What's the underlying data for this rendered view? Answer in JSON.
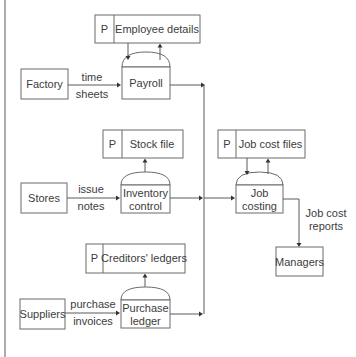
{
  "diagram": {
    "type": "data-flow-diagram",
    "external_entities": [
      {
        "id": "factory",
        "label": "Factory"
      },
      {
        "id": "stores",
        "label": "Stores"
      },
      {
        "id": "suppliers",
        "label": "Suppliers"
      },
      {
        "id": "managers",
        "label": "Managers"
      }
    ],
    "data_stores": [
      {
        "id": "employee_details",
        "prefix": "P",
        "label": "Employee details"
      },
      {
        "id": "stock_file",
        "prefix": "P",
        "label": "Stock file"
      },
      {
        "id": "job_cost_files",
        "prefix": "P",
        "label": "Job cost files"
      },
      {
        "id": "creditors_ledgers",
        "prefix": "P",
        "label": "Creditors' ledgers"
      }
    ],
    "processes": [
      {
        "id": "payroll",
        "lines": [
          "Payroll"
        ]
      },
      {
        "id": "inventory_control",
        "lines": [
          "Inventory",
          "control"
        ]
      },
      {
        "id": "job_costing",
        "lines": [
          "Job",
          "costing"
        ]
      },
      {
        "id": "purchase_ledger",
        "lines": [
          "Purchase",
          "ledger"
        ]
      }
    ],
    "flows": [
      {
        "from": "factory",
        "to": "payroll",
        "label": [
          "time",
          "sheets"
        ]
      },
      {
        "from": "stores",
        "to": "inventory_control",
        "label": [
          "issue",
          "notes"
        ]
      },
      {
        "from": "suppliers",
        "to": "purchase_ledger",
        "label": [
          "purchase",
          "invoices"
        ]
      },
      {
        "from": "job_costing",
        "to": "managers",
        "label": [
          "Job cost",
          "reports"
        ]
      },
      {
        "from": "employee_details",
        "to": "payroll",
        "label": []
      },
      {
        "from": "payroll",
        "to": "employee_details",
        "label": []
      },
      {
        "from": "inventory_control",
        "to": "stock_file",
        "label": []
      },
      {
        "from": "job_cost_files",
        "to": "job_costing",
        "label": []
      },
      {
        "from": "job_costing",
        "to": "job_cost_files",
        "label": []
      },
      {
        "from": "purchase_ledger",
        "to": "creditors_ledgers",
        "label": []
      },
      {
        "from": "payroll",
        "to": "job_costing",
        "label": []
      },
      {
        "from": "inventory_control",
        "to": "job_costing",
        "label": []
      },
      {
        "from": "purchase_ledger",
        "to": "job_costing",
        "label": []
      }
    ]
  }
}
